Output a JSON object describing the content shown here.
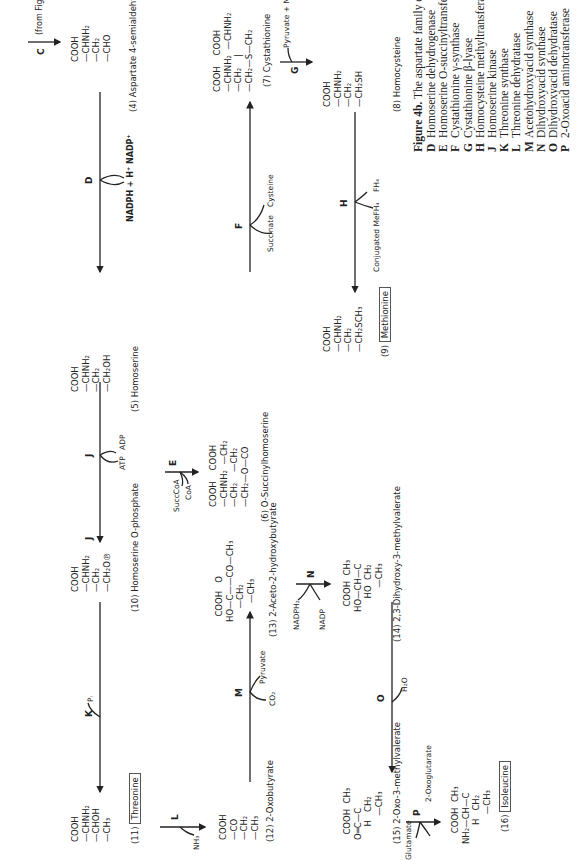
{
  "figure": {
    "title_bold": "Figure 4b.",
    "title_text": " The aspartate family of amino acids: enzymes ",
    "title_enzymes": "D–P."
  },
  "entry": {
    "enzyme": "C",
    "note": "(from Fig. 4a)"
  },
  "compounds": {
    "c4": {
      "lines": [
        "COOH",
        "—CHNH₂",
        "—CH₂",
        "—CHO"
      ],
      "name": "(4)  Aspartate 4-semialdehyde"
    },
    "c5": {
      "lines": [
        "COOH",
        "—CHNH₂",
        "—CH₂",
        "—CH₂OH"
      ],
      "name": "(5)  Homoserine"
    },
    "c6": {
      "lines": [
        "COOH    COOH",
        "—CHNH₂  —CH₂",
        "—CH₂    —CH₂",
        "—CH₂—O—CO"
      ],
      "name": "(6)  O-Succinylhomoserine"
    },
    "c7": {
      "lines": [
        "COOH    COOH",
        "—CHNH₂  —CHNH₂",
        "—CH₂    |",
        "—CH₂—S—CH₂"
      ],
      "name": "(7)  Cystathionine"
    },
    "c8": {
      "lines": [
        "COOH",
        "—CHNH₂",
        "—CH₂",
        "—CH₂SH"
      ],
      "name": "(8)  Homocysteine"
    },
    "c9": {
      "lines": [
        "COOH",
        "—CHNH₂",
        "—CH₂",
        "—CH₂SCH₃"
      ],
      "name_num": "(9)",
      "name_boxed": "Methionine"
    },
    "c10": {
      "lines": [
        "COOH",
        "—CHNH₂",
        "—CH₂",
        "—CH₂O℗"
      ],
      "name": "(10)  Homoserine O-phosphate"
    },
    "c11": {
      "lines": [
        "COOH",
        "—CHNH₂",
        "—CHOH",
        "—CH₃"
      ],
      "name_num": "(11)",
      "name_boxed": "Threonine"
    },
    "c12": {
      "lines": [
        "COOH",
        "—CO",
        "—CH₂",
        "—CH₃"
      ],
      "name": "(12)  2-Oxobutyrate"
    },
    "c13": {
      "lines": [
        "  COOH   O   ",
        "HO—C——CO—CH₃",
        "     —CH₂",
        "       —CH₃"
      ],
      "name": "(13)  2-Aceto-2-hydroxybutyrate"
    },
    "c14": {
      "lines": [
        "  COOH  CH₃",
        "HO—CH—C",
        "     HO  CH₂",
        "         —CH₃"
      ],
      "name": "(14)  2,3-Dihydroxy-3-methylvalerate"
    },
    "c15": {
      "lines": [
        "  COOH  CH₃",
        "O═C—C",
        "     H   CH₂",
        "         —CH₃"
      ],
      "name": "(15)  2-Oxo-3-methylvalerate"
    },
    "c16": {
      "lines": [
        "    COOH  CH₃",
        "NH₂—CH—C",
        "       H   CH₂",
        "           —CH₃"
      ],
      "name_num": "(16)",
      "name_boxed": "Isoleucine"
    }
  },
  "reactions": {
    "D": {
      "label": "D",
      "cofactors": "NADPH + H⁺  NADP⁺"
    },
    "E": {
      "label": "E",
      "in": "SuccCoA",
      "out": "CoA"
    },
    "F": {
      "label": "F",
      "in": "Cysteine",
      "out": "Succinate"
    },
    "G": {
      "label": "G",
      "out": "Pyruvate + NH₃"
    },
    "H": {
      "label": "H",
      "in": "Conjugated MeFH₄",
      "out": "FH₄"
    },
    "J1": {
      "label": "J",
      "in": "ATP",
      "out": "ADP"
    },
    "J2": {
      "label": "J"
    },
    "K": {
      "label": "K",
      "out": "Pᵢ"
    },
    "L": {
      "label": "L",
      "out": "NH₃"
    },
    "M": {
      "label": "M",
      "in": "Pyruvate",
      "out": "CO₂"
    },
    "N": {
      "label": "N",
      "in": "NADPH₂",
      "out": "NADP"
    },
    "O": {
      "label": "O",
      "out": "H₂O"
    },
    "P": {
      "label": "P",
      "in": "Glutamate",
      "out": "2-Oxoglutarate"
    }
  },
  "legend": [
    {
      "key": "D",
      "text": "Homoserine dehydrogenase"
    },
    {
      "key": "E",
      "text": "Homoserine O-succinyltransferase"
    },
    {
      "key": "F",
      "text": "Cystathionine γ-synthase"
    },
    {
      "key": "G",
      "text": "Cystathionine β-lyase"
    },
    {
      "key": "H",
      "text": "Homocysteine methyltransferase"
    },
    {
      "key": "J",
      "text": "Homoserine kinase"
    },
    {
      "key": "K",
      "text": "Threonine synthase"
    },
    {
      "key": "L",
      "text": "Threonine dehydratase"
    },
    {
      "key": "M",
      "text": "Acetohydroxyacid synthase"
    },
    {
      "key": "N",
      "text": "Dihydroxyacid synthase"
    },
    {
      "key": "O",
      "text": "Dihydroxyacid dehydratase"
    },
    {
      "key": "P",
      "text": "2-Oxoacid aminotransferase"
    }
  ]
}
